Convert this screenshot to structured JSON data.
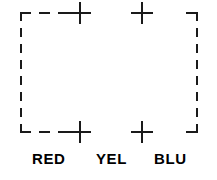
{
  "diagram": {
    "type": "registration-marks",
    "canvas": {
      "width": 217,
      "height": 180,
      "background": "#ffffff"
    },
    "stroke_color": "#1a1a1a",
    "frame": {
      "name": "dashed-registration-frame",
      "left": 20,
      "right": 198,
      "top": 12,
      "bottom": 133,
      "stroke_width": 2,
      "dash_pattern": "9 7",
      "corner_stub_length": 12
    },
    "marks": [
      {
        "name": "crosshair-top-left",
        "x": 80,
        "y": 12,
        "arm": 11
      },
      {
        "name": "crosshair-top-right",
        "x": 142,
        "y": 12,
        "arm": 11
      },
      {
        "name": "crosshair-bottom-left",
        "x": 80,
        "y": 133,
        "arm": 11
      },
      {
        "name": "crosshair-bottom-right",
        "x": 142,
        "y": 133,
        "arm": 11
      }
    ],
    "labels": [
      {
        "name": "label-red",
        "text": "RED",
        "x": 32
      },
      {
        "name": "label-yel",
        "text": "YEL",
        "x": 96
      },
      {
        "name": "label-blu",
        "text": "BLU",
        "x": 154
      }
    ]
  }
}
